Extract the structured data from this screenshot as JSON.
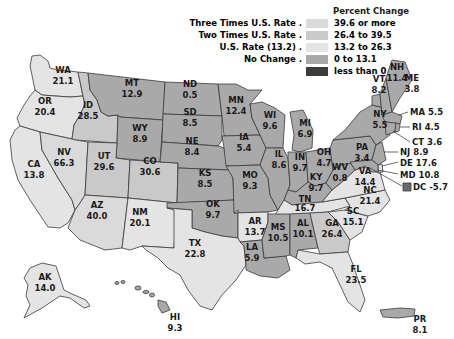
{
  "legend": {
    "title": "Percent Change",
    "rows": [
      {
        "category": "Three Times U.S. Rate .",
        "range": "39.6 or more",
        "color": "#dadada"
      },
      {
        "category": "Two Times U.S. Rate .",
        "range": "26.4 to 39.5",
        "color": "#c9c9c9"
      },
      {
        "category": "U.S. Rate (13.2) .",
        "range": "13.2 to 26.3",
        "color": "#e4e4e4"
      },
      {
        "category": "No Change .",
        "range": "0 to 13.1",
        "color": "#a9a9a9"
      },
      {
        "category": "",
        "range": "less than 0",
        "color": "#3c3c3c"
      }
    ]
  },
  "states": {
    "WA": {
      "abbr": "WA",
      "value": "21.1"
    },
    "OR": {
      "abbr": "OR",
      "value": "20.4"
    },
    "CA": {
      "abbr": "CA",
      "value": "13.8"
    },
    "ID": {
      "abbr": "ID",
      "value": "28.5"
    },
    "NV": {
      "abbr": "NV",
      "value": "66.3"
    },
    "MT": {
      "abbr": "MT",
      "value": "12.9"
    },
    "WY": {
      "abbr": "WY",
      "value": "8.9"
    },
    "UT": {
      "abbr": "UT",
      "value": "29.6"
    },
    "CO": {
      "abbr": "CO",
      "value": "30.6"
    },
    "AZ": {
      "abbr": "AZ",
      "value": "40.0"
    },
    "NM": {
      "abbr": "NM",
      "value": "20.1"
    },
    "ND": {
      "abbr": "ND",
      "value": "0.5"
    },
    "SD": {
      "abbr": "SD",
      "value": "8.5"
    },
    "NE": {
      "abbr": "NE",
      "value": "8.4"
    },
    "KS": {
      "abbr": "KS",
      "value": "8.5"
    },
    "OK": {
      "abbr": "OK",
      "value": "9.7"
    },
    "TX": {
      "abbr": "TX",
      "value": "22.8"
    },
    "MN": {
      "abbr": "MN",
      "value": "12.4"
    },
    "IA": {
      "abbr": "IA",
      "value": "5.4"
    },
    "MO": {
      "abbr": "MO",
      "value": "9.3"
    },
    "AR": {
      "abbr": "AR",
      "value": "13.7"
    },
    "LA": {
      "abbr": "LA",
      "value": "5.9"
    },
    "WI": {
      "abbr": "WI",
      "value": "9.6"
    },
    "IL": {
      "abbr": "IL",
      "value": "8.6"
    },
    "MI": {
      "abbr": "MI",
      "value": "6.9"
    },
    "IN": {
      "abbr": "IN",
      "value": "9.7"
    },
    "OH": {
      "abbr": "OH",
      "value": "4.7"
    },
    "KY": {
      "abbr": "KY",
      "value": "9.7"
    },
    "TN": {
      "abbr": "TN",
      "value": "16.7"
    },
    "MS": {
      "abbr": "MS",
      "value": "10.5"
    },
    "AL": {
      "abbr": "AL",
      "value": "10.1"
    },
    "GA": {
      "abbr": "GA",
      "value": "26.4"
    },
    "FL": {
      "abbr": "FL",
      "value": "23.5"
    },
    "SC": {
      "abbr": "SC",
      "value": "15.1"
    },
    "NC": {
      "abbr": "NC",
      "value": "21.4"
    },
    "VA": {
      "abbr": "VA",
      "value": "14.4"
    },
    "WV": {
      "abbr": "WV",
      "value": "0.8"
    },
    "PA": {
      "abbr": "PA",
      "value": "3.4"
    },
    "NY": {
      "abbr": "NY",
      "value": "5.5"
    },
    "VT": {
      "abbr": "VT",
      "value": "8.2"
    },
    "NH": {
      "abbr": "NH",
      "value": "11.4"
    },
    "ME": {
      "abbr": "ME",
      "value": "3.8"
    },
    "MA": {
      "label": "MA 5.5"
    },
    "RI": {
      "label": "RI 4.5"
    },
    "CT": {
      "label": "CT 3.6"
    },
    "NJ": {
      "label": "NJ 8.9"
    },
    "DE": {
      "label": "DE 17.6"
    },
    "MD": {
      "label": "MD 10.8"
    },
    "DC": {
      "label": "DC -5.7"
    },
    "AK": {
      "abbr": "AK",
      "value": "14.0"
    },
    "HI": {
      "abbr": "HI",
      "value": "9.3"
    },
    "PR": {
      "abbr": "PR",
      "value": "8.1"
    }
  },
  "colors": {
    "three_times": "#dadada",
    "two_times": "#c9c9c9",
    "us_rate": "#e4e4e4",
    "no_change": "#a9a9a9",
    "negative": "#3c3c3c"
  }
}
